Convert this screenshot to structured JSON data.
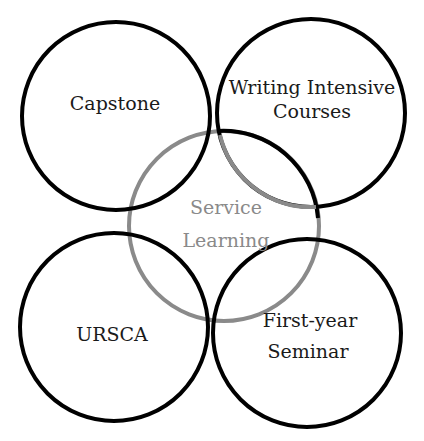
{
  "diagram": {
    "type": "overlapping-circles",
    "colors": {
      "outer_stroke": "#000000",
      "center_stroke": "#8a8a8a",
      "center_text": "#8a8a8a",
      "outer_text": "#1a1a1a"
    },
    "circles": [
      {
        "id": "capstone",
        "lines": [
          "Capstone"
        ]
      },
      {
        "id": "writing",
        "lines": [
          "Writing Intensive",
          "Courses"
        ]
      },
      {
        "id": "ursca",
        "lines": [
          "URSCA"
        ]
      },
      {
        "id": "first-year",
        "lines": [
          "First-year",
          "Seminar"
        ]
      },
      {
        "id": "service",
        "lines": [
          "Service",
          "Learning"
        ]
      }
    ]
  }
}
